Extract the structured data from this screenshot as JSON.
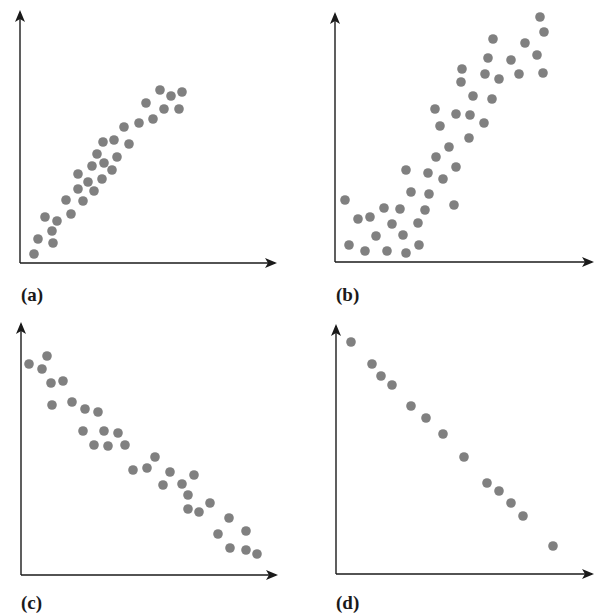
{
  "figure": {
    "panel_labels": [
      "(a)",
      "(b)",
      "(c)",
      "(d)"
    ],
    "colors": {
      "axis": "#1a1a1a",
      "dot": "#808080",
      "background": "#ffffff"
    }
  },
  "chart_data": [
    {
      "type": "scatter",
      "label": "(a)",
      "title": "",
      "xlabel": "",
      "ylabel": "",
      "grid": false,
      "description": "positive correlation, moderate scatter",
      "frame": {
        "origin": [
          20,
          263
        ],
        "x_end": [
          275,
          263
        ],
        "y_top": [
          20,
          12
        ]
      },
      "points": [
        [
          34,
          254
        ],
        [
          38,
          239
        ],
        [
          45,
          217
        ],
        [
          52,
          231
        ],
        [
          53,
          243
        ],
        [
          57,
          221
        ],
        [
          66,
          200
        ],
        [
          71,
          214
        ],
        [
          78,
          174
        ],
        [
          78,
          189
        ],
        [
          83,
          201
        ],
        [
          88,
          182
        ],
        [
          92,
          166
        ],
        [
          94,
          191
        ],
        [
          97,
          154
        ],
        [
          102,
          179
        ],
        [
          103,
          142
        ],
        [
          104,
          163
        ],
        [
          112,
          170
        ],
        [
          114,
          140
        ],
        [
          117,
          157
        ],
        [
          124,
          127
        ],
        [
          129,
          144
        ],
        [
          139,
          123
        ],
        [
          146,
          103
        ],
        [
          153,
          119
        ],
        [
          160,
          90
        ],
        [
          164,
          109
        ],
        [
          171,
          96
        ],
        [
          179,
          109
        ],
        [
          182,
          92
        ]
      ]
    },
    {
      "type": "scatter",
      "label": "(b)",
      "title": "",
      "xlabel": "",
      "ylabel": "",
      "grid": false,
      "description": "positive correlation, larger scatter",
      "frame": {
        "origin": [
          335,
          262
        ],
        "x_end": [
          592,
          262
        ],
        "y_top": [
          335,
          14
        ]
      },
      "points": [
        [
          345,
          200
        ],
        [
          349,
          245
        ],
        [
          358,
          219
        ],
        [
          365,
          251
        ],
        [
          370,
          217
        ],
        [
          376,
          236
        ],
        [
          384,
          208
        ],
        [
          387,
          251
        ],
        [
          392,
          224
        ],
        [
          400,
          209
        ],
        [
          403,
          235
        ],
        [
          406,
          170
        ],
        [
          406,
          253
        ],
        [
          411,
          192
        ],
        [
          418,
          223
        ],
        [
          419,
          245
        ],
        [
          425,
          210
        ],
        [
          428,
          173
        ],
        [
          429,
          194
        ],
        [
          435,
          109
        ],
        [
          436,
          157
        ],
        [
          440,
          126
        ],
        [
          443,
          179
        ],
        [
          449,
          147
        ],
        [
          454,
          205
        ],
        [
          456,
          114
        ],
        [
          456,
          167
        ],
        [
          461,
          82
        ],
        [
          462,
          69
        ],
        [
          469,
          138
        ],
        [
          470,
          115
        ],
        [
          473,
          96
        ],
        [
          484,
          123
        ],
        [
          485,
          74
        ],
        [
          488,
          58
        ],
        [
          492,
          99
        ],
        [
          493,
          39
        ],
        [
          499,
          79
        ],
        [
          511,
          60
        ],
        [
          519,
          74
        ],
        [
          525,
          43
        ],
        [
          537,
          55
        ],
        [
          540,
          17
        ],
        [
          543,
          73
        ],
        [
          544,
          32
        ]
      ]
    },
    {
      "type": "scatter",
      "label": "(c)",
      "title": "",
      "xlabel": "",
      "ylabel": "",
      "grid": false,
      "description": "negative correlation, moderate scatter",
      "frame": {
        "origin": [
          21,
          575
        ],
        "x_end": [
          276,
          575
        ],
        "y_top": [
          21,
          324
        ]
      },
      "points": [
        [
          29,
          364
        ],
        [
          42,
          369
        ],
        [
          47,
          356
        ],
        [
          51,
          383
        ],
        [
          52,
          405
        ],
        [
          63,
          381
        ],
        [
          72,
          402
        ],
        [
          85,
          409
        ],
        [
          83,
          431
        ],
        [
          94,
          445
        ],
        [
          98,
          412
        ],
        [
          104,
          431
        ],
        [
          108,
          446
        ],
        [
          118,
          433
        ],
        [
          125,
          445
        ],
        [
          133,
          470
        ],
        [
          147,
          468
        ],
        [
          155,
          457
        ],
        [
          163,
          485
        ],
        [
          170,
          472
        ],
        [
          182,
          484
        ],
        [
          188,
          495
        ],
        [
          194,
          475
        ],
        [
          188,
          509
        ],
        [
          199,
          512
        ],
        [
          210,
          503
        ],
        [
          218,
          534
        ],
        [
          229,
          518
        ],
        [
          230,
          548
        ],
        [
          246,
          531
        ],
        [
          246,
          550
        ],
        [
          257,
          554
        ]
      ]
    },
    {
      "type": "scatter",
      "label": "(d)",
      "title": "",
      "xlabel": "",
      "ylabel": "",
      "grid": false,
      "description": "perfect negative linear correlation",
      "frame": {
        "origin": [
          336,
          574
        ],
        "x_end": [
          592,
          574
        ],
        "y_top": [
          336,
          326
        ]
      },
      "points": [
        [
          351,
          342
        ],
        [
          372,
          364
        ],
        [
          381,
          376
        ],
        [
          392,
          385
        ],
        [
          411,
          406
        ],
        [
          426,
          418
        ],
        [
          443,
          434
        ],
        [
          464,
          457
        ],
        [
          487,
          483
        ],
        [
          499,
          491
        ],
        [
          511,
          503
        ],
        [
          523,
          516
        ],
        [
          553,
          546
        ]
      ]
    }
  ]
}
